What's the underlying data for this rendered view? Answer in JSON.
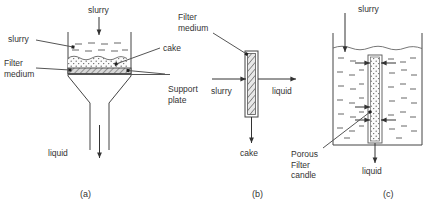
{
  "figure": {
    "background": "#ffffff",
    "line_color": "#444444",
    "text_color": "#333333",
    "cake_fill": "#f2f2f2",
    "medium_fill": "#d8d8d8"
  },
  "panels": [
    {
      "id": "a",
      "caption": "(a)",
      "name": "cake-filtration-vessel",
      "labels": {
        "top_feed": "slurry",
        "left_top": "slurry",
        "left_bottom": "Filter\nmedium",
        "right_top": "cake",
        "right_bottom": "Support\nplate",
        "outlet": "liquid"
      },
      "layers": [
        {
          "name": "slurry-layer",
          "texture": "dashes"
        },
        {
          "name": "cake-layer",
          "texture": "stipple"
        },
        {
          "name": "filter-medium-band",
          "texture": "hatch"
        }
      ]
    },
    {
      "id": "b",
      "caption": "(b)",
      "name": "crossflow-filter-medium",
      "labels": {
        "top": "Filter\nmedium",
        "inlet": "slurry",
        "outlet": "liquid",
        "bottom": "cake"
      }
    },
    {
      "id": "c",
      "caption": "(c)",
      "name": "porous-filter-candle-tank",
      "labels": {
        "top_feed": "slurry",
        "element": "Porous\nFilter\ncandle",
        "outlet": "liquid"
      }
    }
  ]
}
